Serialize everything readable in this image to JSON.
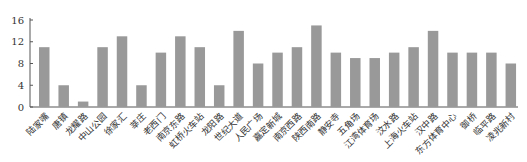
{
  "chart_data": {
    "type": "bar",
    "title": "",
    "xlabel": "",
    "ylabel": "",
    "ylim": [
      0,
      16
    ],
    "yticks": [
      0,
      4,
      8,
      12,
      16
    ],
    "grid": false,
    "legend": null,
    "bar_color": "#999999",
    "categories": [
      "陆家嘴",
      "唐镇",
      "龙耀路",
      "中山公园",
      "徐家汇",
      "莘庄",
      "老西门",
      "南京东路",
      "虹桥火车站",
      "龙阳路",
      "世纪大道",
      "人民广场",
      "嘉定新城",
      "南京西路",
      "陕西南路",
      "静安寺",
      "五角场",
      "江湾体育场",
      "汶水路",
      "上海火车站",
      "汉中路",
      "东方体育中心",
      "御桥",
      "临平路",
      "凌兆新村"
    ],
    "values": [
      11,
      4,
      1,
      11,
      13,
      4,
      10,
      13,
      11,
      4,
      14,
      8,
      10,
      11,
      15,
      10,
      9,
      9,
      10,
      11,
      14,
      10,
      10,
      10,
      8
    ]
  }
}
